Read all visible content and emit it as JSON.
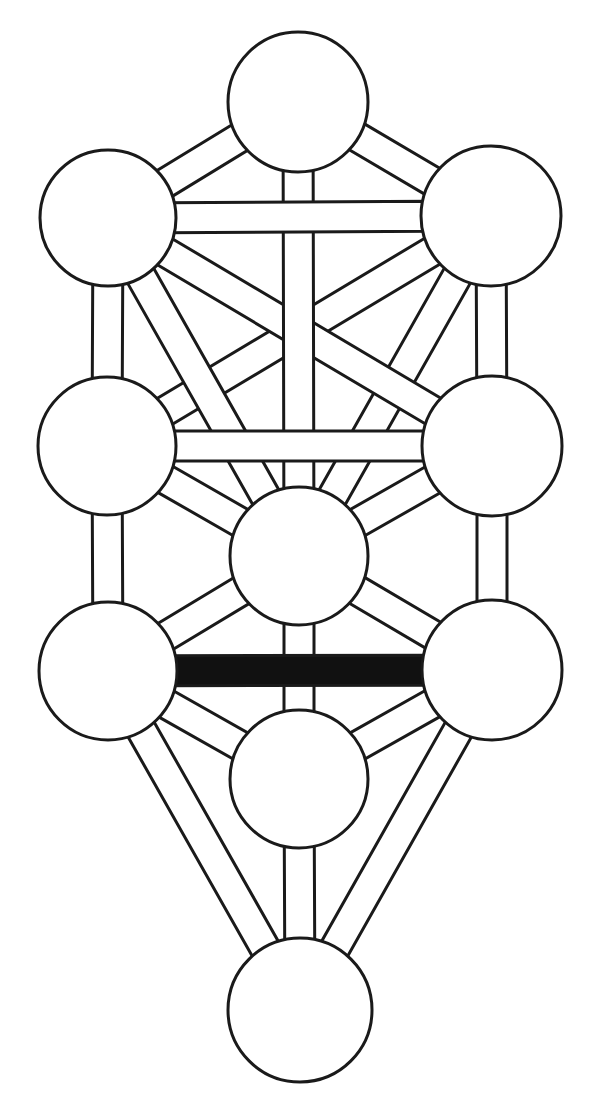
{
  "diagram": {
    "subtitle": "Kabbalistic Sephirotic Diagram",
    "canvas": {
      "width": 599,
      "height": 1108
    },
    "style": {
      "background_color": "#FFFFFF",
      "stroke_color": "#1A1A1A",
      "node_fill": "#FFFFFF",
      "path_fill": "#FFFFFF",
      "highlight_fill": "#111111",
      "node_stroke_width": 3,
      "path_stroke_width": 3,
      "path_band_width": 30
    },
    "counts": {
      "nodes_label": "Sephirot",
      "nodes_total": "10",
      "paths_label": "Paths",
      "paths_total": "22",
      "highlighted_label": "Highlighted Path",
      "highlighted_total": "1"
    },
    "nodes": [
      {
        "id": "kether",
        "label": "Kether",
        "number": "1",
        "cx": 298,
        "cy": 102,
        "r": 70,
        "pillar": "middle",
        "fill": "#FFFFFF"
      },
      {
        "id": "chokmah",
        "label": "Chokmah",
        "number": "2",
        "cx": 491,
        "cy": 216,
        "r": 70,
        "pillar": "right",
        "fill": "#FFFFFF"
      },
      {
        "id": "binah",
        "label": "Binah",
        "number": "3",
        "cx": 108,
        "cy": 218,
        "r": 68,
        "pillar": "left",
        "fill": "#FFFFFF"
      },
      {
        "id": "chesed",
        "label": "Chesed",
        "number": "4",
        "cx": 492,
        "cy": 446,
        "r": 70,
        "pillar": "right",
        "fill": "#FFFFFF"
      },
      {
        "id": "geburah",
        "label": "Geburah",
        "number": "5",
        "cx": 107,
        "cy": 446,
        "r": 69,
        "pillar": "left",
        "fill": "#FFFFFF"
      },
      {
        "id": "tiphareth",
        "label": "Tiphareth",
        "number": "6",
        "cx": 299,
        "cy": 556,
        "r": 69,
        "pillar": "middle",
        "fill": "#FFFFFF"
      },
      {
        "id": "netzach",
        "label": "Netzach",
        "number": "7",
        "cx": 492,
        "cy": 670,
        "r": 70,
        "pillar": "right",
        "fill": "#FFFFFF"
      },
      {
        "id": "hod",
        "label": "Hod",
        "number": "8",
        "cx": 108,
        "cy": 671,
        "r": 69,
        "pillar": "left",
        "fill": "#FFFFFF"
      },
      {
        "id": "yesod",
        "label": "Yesod",
        "number": "9",
        "cx": 299,
        "cy": 779,
        "r": 69,
        "pillar": "middle",
        "fill": "#FFFFFF"
      },
      {
        "id": "malkuth",
        "label": "Malkuth",
        "number": "10",
        "cx": 300,
        "cy": 1010,
        "r": 72,
        "pillar": "middle",
        "fill": "#FFFFFF"
      }
    ],
    "paths": [
      {
        "id": "path-kether-chokmah",
        "from": "kether",
        "to": "chokmah",
        "orientation": "diagonal",
        "highlighted": false,
        "fill": "#FFFFFF"
      },
      {
        "id": "path-kether-binah",
        "from": "kether",
        "to": "binah",
        "orientation": "diagonal",
        "highlighted": false,
        "fill": "#FFFFFF"
      },
      {
        "id": "path-kether-tiphareth",
        "from": "kether",
        "to": "tiphareth",
        "orientation": "vertical",
        "highlighted": false,
        "fill": "#FFFFFF"
      },
      {
        "id": "path-chokmah-binah",
        "from": "chokmah",
        "to": "binah",
        "orientation": "horizontal",
        "highlighted": false,
        "fill": "#FFFFFF"
      },
      {
        "id": "path-chokmah-chesed",
        "from": "chokmah",
        "to": "chesed",
        "orientation": "vertical",
        "highlighted": false,
        "fill": "#FFFFFF"
      },
      {
        "id": "path-chokmah-tiphareth",
        "from": "chokmah",
        "to": "tiphareth",
        "orientation": "diagonal",
        "highlighted": false,
        "fill": "#FFFFFF"
      },
      {
        "id": "path-chokmah-geburah",
        "from": "chokmah",
        "to": "geburah",
        "orientation": "diagonal",
        "highlighted": false,
        "fill": "#FFFFFF"
      },
      {
        "id": "path-binah-geburah",
        "from": "binah",
        "to": "geburah",
        "orientation": "vertical",
        "highlighted": false,
        "fill": "#FFFFFF"
      },
      {
        "id": "path-binah-tiphareth",
        "from": "binah",
        "to": "tiphareth",
        "orientation": "diagonal",
        "highlighted": false,
        "fill": "#FFFFFF"
      },
      {
        "id": "path-binah-chesed",
        "from": "binah",
        "to": "chesed",
        "orientation": "diagonal",
        "highlighted": false,
        "fill": "#FFFFFF"
      },
      {
        "id": "path-chesed-geburah",
        "from": "chesed",
        "to": "geburah",
        "orientation": "horizontal",
        "highlighted": false,
        "fill": "#FFFFFF"
      },
      {
        "id": "path-chesed-tiphareth",
        "from": "chesed",
        "to": "tiphareth",
        "orientation": "diagonal",
        "highlighted": false,
        "fill": "#FFFFFF"
      },
      {
        "id": "path-chesed-netzach",
        "from": "chesed",
        "to": "netzach",
        "orientation": "vertical",
        "highlighted": false,
        "fill": "#FFFFFF"
      },
      {
        "id": "path-geburah-tiphareth",
        "from": "geburah",
        "to": "tiphareth",
        "orientation": "diagonal",
        "highlighted": false,
        "fill": "#FFFFFF"
      },
      {
        "id": "path-geburah-hod",
        "from": "geburah",
        "to": "hod",
        "orientation": "vertical",
        "highlighted": false,
        "fill": "#FFFFFF"
      },
      {
        "id": "path-tiphareth-netzach",
        "from": "tiphareth",
        "to": "netzach",
        "orientation": "diagonal",
        "highlighted": false,
        "fill": "#FFFFFF"
      },
      {
        "id": "path-tiphareth-hod",
        "from": "tiphareth",
        "to": "hod",
        "orientation": "diagonal",
        "highlighted": false,
        "fill": "#FFFFFF"
      },
      {
        "id": "path-tiphareth-yesod",
        "from": "tiphareth",
        "to": "yesod",
        "orientation": "vertical",
        "highlighted": false,
        "fill": "#FFFFFF"
      },
      {
        "id": "path-netzach-hod",
        "from": "netzach",
        "to": "hod",
        "orientation": "horizontal",
        "highlighted": true,
        "fill": "#111111"
      },
      {
        "id": "path-netzach-yesod",
        "from": "netzach",
        "to": "yesod",
        "orientation": "diagonal",
        "highlighted": false,
        "fill": "#FFFFFF"
      },
      {
        "id": "path-netzach-malkuth",
        "from": "netzach",
        "to": "malkuth",
        "orientation": "diagonal",
        "highlighted": false,
        "fill": "#FFFFFF"
      },
      {
        "id": "path-hod-yesod",
        "from": "hod",
        "to": "yesod",
        "orientation": "diagonal",
        "highlighted": false,
        "fill": "#FFFFFF"
      },
      {
        "id": "path-hod-malkuth",
        "from": "hod",
        "to": "malkuth",
        "orientation": "diagonal",
        "highlighted": false,
        "fill": "#FFFFFF"
      },
      {
        "id": "path-yesod-malkuth",
        "from": "yesod",
        "to": "malkuth",
        "orientation": "vertical",
        "highlighted": false,
        "fill": "#FFFFFF"
      }
    ]
  }
}
